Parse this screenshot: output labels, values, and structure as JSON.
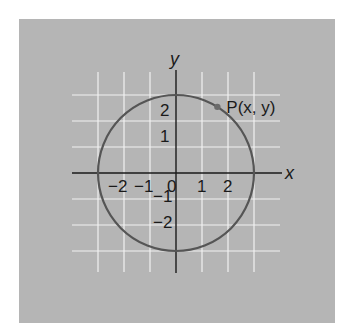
{
  "figure": {
    "background_color": "#b5b5b5",
    "grid_color": "#f2f2f2",
    "axis_color": "#1a1a1a",
    "circle_color": "#555555",
    "panel": {
      "x": 19,
      "y": 19,
      "width": 316,
      "height": 304
    },
    "origin_px": {
      "x": 176,
      "y": 173
    },
    "unit_px": 26,
    "grid_range": {
      "min": -3,
      "max": 3
    },
    "axes": {
      "x_label": "x",
      "y_label": "y"
    },
    "x_ticks": [
      {
        "value": -2,
        "label": "−2"
      },
      {
        "value": -1,
        "label": "−1"
      },
      {
        "value": 0,
        "label": "0"
      },
      {
        "value": 1,
        "label": "1"
      },
      {
        "value": 2,
        "label": "2"
      }
    ],
    "y_ticks": [
      {
        "value": 2,
        "label": "2"
      },
      {
        "value": 1,
        "label": "1"
      },
      {
        "value": -1,
        "label": "−1"
      },
      {
        "value": -2,
        "label": "−2"
      }
    ],
    "circle": {
      "center": [
        0,
        0
      ],
      "radius": 3
    },
    "point": {
      "label": "P(x, y)",
      "angle_deg": 58
    }
  }
}
